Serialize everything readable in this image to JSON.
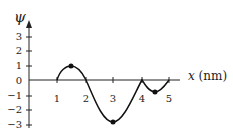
{
  "diagram": {
    "y_label": "ψ",
    "x_label": "x (nm)",
    "y_ticks": [
      "3",
      "2",
      "1",
      "0",
      "−1",
      "−2",
      "−3"
    ],
    "x_ticks": [
      "1",
      "2",
      "3",
      "4",
      "5"
    ],
    "marked_points": [
      {
        "x": 1.5,
        "y": 1
      },
      {
        "x": 3,
        "y": -2.75
      },
      {
        "x": 4.5,
        "y": -0.8
      }
    ],
    "curve": [
      [
        1,
        0
      ],
      [
        1.5,
        1
      ],
      [
        2,
        0
      ],
      [
        3,
        -2.75
      ],
      [
        4,
        0
      ],
      [
        4.5,
        -0.8
      ],
      [
        5,
        0
      ]
    ]
  }
}
